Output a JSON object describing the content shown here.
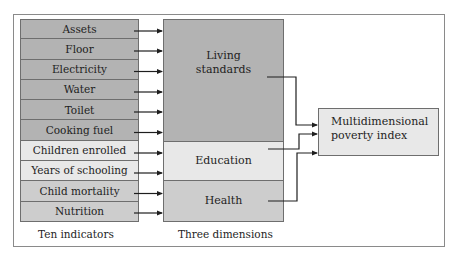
{
  "diagram": {
    "indicators": [
      {
        "label": "Assets",
        "dimension": "living"
      },
      {
        "label": "Floor",
        "dimension": "living"
      },
      {
        "label": "Electricity",
        "dimension": "living"
      },
      {
        "label": "Water",
        "dimension": "living"
      },
      {
        "label": "Toilet",
        "dimension": "living"
      },
      {
        "label": "Cooking fuel",
        "dimension": "living"
      },
      {
        "label": "Children enrolled",
        "dimension": "education"
      },
      {
        "label": "Years of schooling",
        "dimension": "education"
      },
      {
        "label": "Child mortality",
        "dimension": "health"
      },
      {
        "label": "Nutrition",
        "dimension": "health"
      }
    ],
    "dimensions": {
      "living": {
        "line1": "Living",
        "line2": "standards"
      },
      "education": {
        "label": "Education"
      },
      "health": {
        "label": "Health"
      }
    },
    "output": {
      "line1": "Multidimensional",
      "line2": "poverty index"
    },
    "captions": {
      "indicators": "Ten indicators",
      "dimensions": "Three dimensions"
    },
    "colors": {
      "living": "#b3b3b3",
      "education": "#e8e8e8",
      "health": "#cdcdcd",
      "output": "#e8e8e8",
      "line": "#1e1e1e"
    }
  }
}
